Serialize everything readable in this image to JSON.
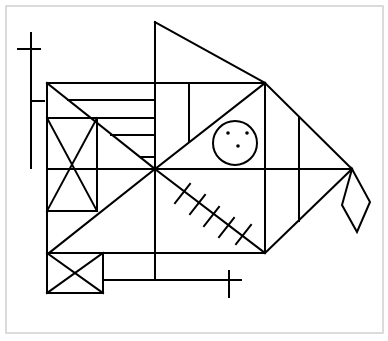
{
  "figure": {
    "colors": {
      "stroke": "#000000",
      "background": "#ffffff",
      "frame": "#d0d0d0"
    },
    "frame": {
      "x": 6,
      "y": 6,
      "width": 377,
      "height": 327
    },
    "shapes": {
      "main_rectangle": {
        "x": 47,
        "y": 83,
        "width": 218,
        "height": 170
      },
      "top_triangle": {
        "points": [
          [
            155,
            22
          ],
          [
            265,
            83
          ],
          [
            155,
            83
          ]
        ]
      },
      "right_triangle": {
        "points": [
          [
            265,
            83
          ],
          [
            352,
            169
          ],
          [
            265,
            253
          ]
        ]
      },
      "left_cross": {
        "vertical": [
          31,
          33,
          31,
          168
        ],
        "crossbar": [
          18,
          49,
          40,
          49
        ],
        "stub": [
          31,
          101,
          44,
          101
        ]
      },
      "inner_box": {
        "x": 47,
        "y": 118,
        "width": 50,
        "height": 93
      },
      "bottom_box": {
        "x": 47,
        "y": 253,
        "width": 56,
        "height": 40
      },
      "bottom_line_cross": {
        "line": [
          103,
          280,
          240,
          280
        ],
        "tick": [
          229,
          270,
          229,
          296
        ]
      },
      "circle": {
        "cx": 235,
        "cy": 143,
        "r": 22,
        "dots": [
          [
            228,
            133
          ],
          [
            247,
            133
          ],
          [
            238,
            146
          ]
        ]
      },
      "diamond": {
        "points": [
          [
            352,
            169
          ],
          [
            370,
            202
          ],
          [
            357,
            232
          ],
          [
            342,
            205
          ]
        ]
      },
      "hatch_count": 5
    }
  }
}
